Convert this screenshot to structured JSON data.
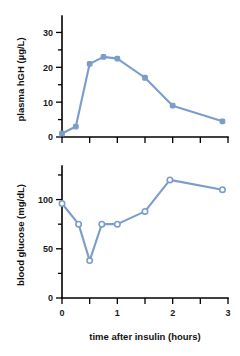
{
  "figure": {
    "shared_xlabel": "time after insulin (hours)",
    "line_color": "#7B9DCB",
    "marker_open_fill": "#FFFFFF",
    "axis_color": "#000000"
  },
  "chart_data": [
    {
      "type": "line",
      "title": "",
      "panel": "top",
      "xlabel": "time after insulin (hours)",
      "ylabel": "plasma hGH (µg/L)",
      "xlim": [
        0,
        3
      ],
      "ylim": [
        0,
        33
      ],
      "xticks": [
        0,
        0.5,
        1,
        1.5,
        2,
        2.5,
        3
      ],
      "xticklabels": [
        "",
        "",
        "",
        "",
        "",
        "",
        ""
      ],
      "yticks": [
        0,
        5,
        10,
        15,
        20,
        25,
        30
      ],
      "yticklabels": [
        "0",
        "",
        "10",
        "",
        "20",
        "",
        "30"
      ],
      "grid": false,
      "legend": false,
      "marker": "filled-square",
      "series": [
        {
          "name": "plasma hGH",
          "color": "#7B9DCB",
          "x": [
            0,
            0.25,
            0.5,
            0.75,
            1.0,
            1.5,
            2.0,
            2.9
          ],
          "values": [
            1,
            3,
            21,
            23,
            22.5,
            17,
            9,
            4.5
          ]
        }
      ]
    },
    {
      "type": "line",
      "title": "",
      "panel": "bottom",
      "xlabel": "time after insulin (hours)",
      "ylabel": "blood glucose (mg/dL)",
      "xlim": [
        0,
        3
      ],
      "ylim": [
        0,
        128
      ],
      "xticks": [
        0,
        0.5,
        1,
        1.5,
        2,
        2.5,
        3
      ],
      "xticklabels": [
        "0",
        "",
        "1",
        "",
        "2",
        "",
        "3"
      ],
      "yticks": [
        0,
        25,
        50,
        75,
        100,
        125
      ],
      "yticklabels": [
        "0",
        "",
        "50",
        "",
        "100",
        ""
      ],
      "grid": false,
      "legend": false,
      "marker": "open-circle",
      "series": [
        {
          "name": "blood glucose",
          "color": "#7B9DCB",
          "x": [
            0,
            0.3,
            0.5,
            0.72,
            1.0,
            1.5,
            1.95,
            2.9
          ],
          "values": [
            96,
            75,
            38,
            75,
            75,
            88,
            120,
            110
          ]
        }
      ]
    }
  ]
}
